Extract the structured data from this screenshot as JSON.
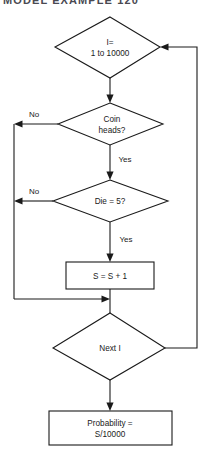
{
  "header": {
    "text": "MODEL EXAMPLE 120"
  },
  "diagram": {
    "nodes": [
      {
        "id": "loop-start",
        "type": "decision",
        "lines": [
          "I=",
          "1 to 10000"
        ]
      },
      {
        "id": "coin-test",
        "type": "decision",
        "lines": [
          "Coin",
          "heads?"
        ]
      },
      {
        "id": "die-test",
        "type": "decision",
        "lines": [
          "Die = 5?"
        ]
      },
      {
        "id": "increment",
        "type": "process",
        "lines": [
          "S = S + 1"
        ]
      },
      {
        "id": "loop-next",
        "type": "decision",
        "lines": [
          "Next I"
        ]
      },
      {
        "id": "result",
        "type": "process",
        "lines": [
          "Probability =",
          "S/10000"
        ]
      }
    ],
    "branch_labels": {
      "coin_no": "No",
      "coin_yes": "Yes",
      "die_no": "No",
      "die_yes": "Yes"
    },
    "colors": {
      "stroke": "#1a1a1a",
      "fill": "#ffffff",
      "header_text": "#4a4a52"
    }
  }
}
